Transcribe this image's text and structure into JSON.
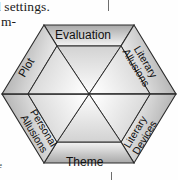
{
  "page": {
    "width": 178,
    "height": 180,
    "background_color": "#fefefe"
  },
  "scan_text": {
    "top_line": "d settings.",
    "left_fragment": "m-",
    "bottom_fragment": "e"
  },
  "diagram": {
    "name": "hexagon-literary-analysis-diagram",
    "shape": "hexagon",
    "segment_count": 6,
    "stroke_color": "#2b2b2b",
    "outer_band_fill_light": "#f2f2f2",
    "outer_band_fill_dark": "#9a9a9a",
    "inner_triangle_fill_light": "#fbfbfb",
    "inner_triangle_fill_dark": "#c9c9c9",
    "segments": [
      {
        "id": "evaluation",
        "label": "Evaluation",
        "position": "top"
      },
      {
        "id": "literary-allusions",
        "label_line1": "Literary",
        "label_line2": "Allusions",
        "position": "upper-right"
      },
      {
        "id": "literary-devices",
        "label_line1": "Literary",
        "label_line2": "Devices",
        "position": "lower-right"
      },
      {
        "id": "theme",
        "label": "Theme",
        "position": "bottom"
      },
      {
        "id": "personal-allusions",
        "label_line1": "Personal",
        "label_line2": "Allusions",
        "position": "lower-left"
      },
      {
        "id": "plot",
        "label": "Plot",
        "position": "upper-left"
      }
    ]
  }
}
